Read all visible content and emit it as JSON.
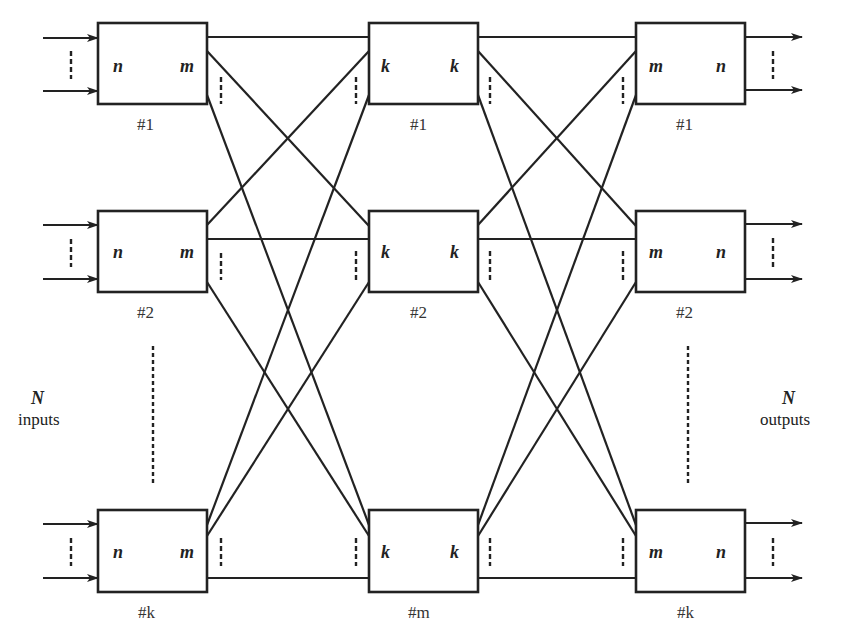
{
  "colors": {
    "stroke": "#222222",
    "background": "#ffffff"
  },
  "side_labels": {
    "left": {
      "symbol": "N",
      "text": "inputs"
    },
    "right": {
      "symbol": "N",
      "text": "outputs"
    }
  },
  "stages": [
    {
      "name": "input-stage",
      "boxes": [
        {
          "id": "#1",
          "left": "n",
          "right": "m"
        },
        {
          "id": "#2",
          "left": "n",
          "right": "m"
        },
        {
          "id": "#k",
          "left": "n",
          "right": "m"
        }
      ]
    },
    {
      "name": "middle-stage",
      "boxes": [
        {
          "id": "#1",
          "left": "k",
          "right": "k"
        },
        {
          "id": "#2",
          "left": "k",
          "right": "k"
        },
        {
          "id": "#m",
          "left": "k",
          "right": "k"
        }
      ]
    },
    {
      "name": "output-stage",
      "boxes": [
        {
          "id": "#1",
          "left": "m",
          "right": "n"
        },
        {
          "id": "#2",
          "left": "m",
          "right": "n"
        },
        {
          "id": "#k",
          "left": "m",
          "right": "n"
        }
      ]
    }
  ]
}
